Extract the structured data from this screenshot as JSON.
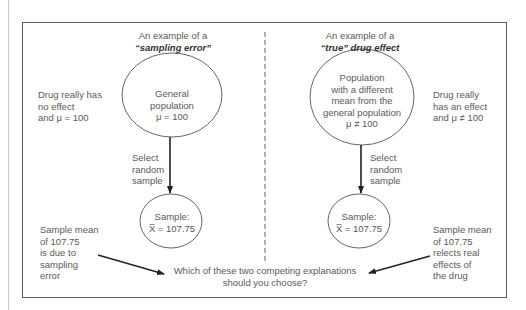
{
  "diagram": {
    "left_panel": {
      "header_line1": "An example of a",
      "header_line2": "“sampling error”",
      "side_note": [
        "Drug really has",
        "no effect",
        "and μ = 100"
      ],
      "population_circle": [
        "General",
        "population",
        "μ = 100"
      ],
      "arrow_label": [
        "Select",
        "random",
        "sample"
      ],
      "sample_circle": [
        "Sample:",
        "X̅ = 107.75"
      ],
      "conclusion": [
        "Sample mean",
        "of 107.75",
        "is due to",
        "sampling",
        "error"
      ]
    },
    "right_panel": {
      "header_line1": "An example of a",
      "header_line2": "“true” drug effect",
      "side_note": [
        "Drug really",
        "has an effect",
        "and μ ≠ 100"
      ],
      "population_circle": [
        "Population",
        "with a different",
        "mean from the",
        "general population",
        "μ ≠ 100"
      ],
      "arrow_label": [
        "Select",
        "random",
        "sample"
      ],
      "sample_circle": [
        "Sample:",
        "X̅ = 107.75"
      ],
      "conclusion": [
        "Sample mean",
        "of 107.75",
        "relects real",
        "effects of",
        "the drug"
      ]
    },
    "question": [
      "Which of these two competing explanations",
      "should you choose?"
    ],
    "colors": {
      "line": "#5a5a5a",
      "arrow": "#222222",
      "text": "#5a5a5a"
    }
  }
}
